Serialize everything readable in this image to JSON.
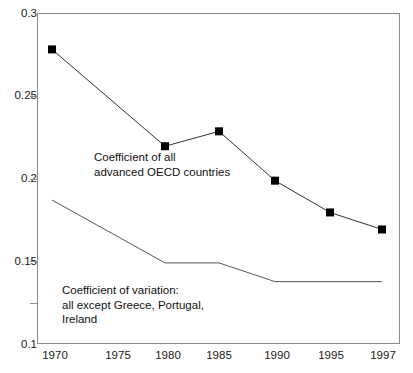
{
  "chart_data": {
    "type": "line",
    "title": "",
    "subtitle": "",
    "xlabel": "",
    "ylabel": "",
    "x": [
      1970,
      1975,
      1980,
      1985,
      1990,
      1995,
      1997
    ],
    "categories": [
      "1970",
      "1975",
      "1980",
      "1985",
      "1990",
      "1995",
      "1997"
    ],
    "xtick_labels": [
      "1970",
      "1975",
      "1980",
      "1985",
      "1990",
      "1995",
      "1997"
    ],
    "ytick_labels": [
      "0.3",
      "0.25",
      "0.2",
      "0.15",
      "0.1"
    ],
    "ytick_values": [
      0.3,
      0.25,
      0.2,
      0.15,
      0.1
    ],
    "yminor_tick_values": [
      0.125
    ],
    "ylim": [
      0.1,
      0.3
    ],
    "xlim": [
      1970,
      1997
    ],
    "grid": false,
    "legend": "annotations-inline",
    "series": [
      {
        "name": "Coefficient of all advanced OECD countries",
        "marker": "filled-square",
        "color": "#000000",
        "x": [
          1970,
          1980,
          1985,
          1990,
          1995,
          1997
        ],
        "values": [
          0.278,
          0.2195,
          0.2285,
          0.1987,
          0.1795,
          0.1692
        ]
      },
      {
        "name": "Coefficient of variation: all except Greece, Portugal, Ireland",
        "marker": "none",
        "color": "#555555",
        "x": [
          1970,
          1980,
          1985,
          1990,
          1997
        ],
        "values": [
          0.187,
          0.149,
          0.149,
          0.1377,
          0.1377
        ]
      }
    ],
    "annotations": [
      {
        "id": "upper",
        "text": "Coefficient of all\nadvanced OECD countries",
        "x": 1976.8,
        "y": 0.2095
      },
      {
        "id": "lower",
        "text": "Coefficient of variation:\nall except Greece, Portugal,\nIreland",
        "x": 1972.0,
        "y": 0.1295
      }
    ]
  },
  "colors": {
    "axis": "#8c8c8c",
    "text": "#1a1a1a",
    "series_primary": "#000000",
    "series_secondary": "#555555",
    "background": "#ffffff"
  }
}
